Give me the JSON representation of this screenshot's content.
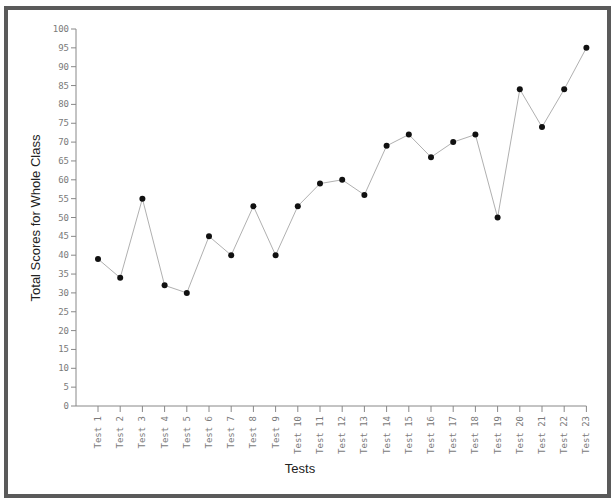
{
  "chart_data": {
    "type": "line",
    "title": "",
    "xlabel": "Tests",
    "ylabel": "Total Scores for Whole Class",
    "categories": [
      "Test 1",
      "Test 2",
      "Test 3",
      "Test 4",
      "Test 5",
      "Test 6",
      "Test 7",
      "Test 8",
      "Test 9",
      "Test 10",
      "Test 11",
      "Test 12",
      "Test 13",
      "Test 14",
      "Test 15",
      "Test 16",
      "Test 17",
      "Test 18",
      "Test 19",
      "Test 20",
      "Test 21",
      "Test 22",
      "Test 23"
    ],
    "values": [
      39,
      34,
      55,
      32,
      30,
      45,
      40,
      53,
      40,
      53,
      59,
      60,
      56,
      69,
      72,
      66,
      70,
      72,
      50,
      84,
      74,
      84,
      95
    ],
    "ylim": [
      0,
      100
    ],
    "yticks": [
      0,
      5,
      10,
      15,
      20,
      25,
      30,
      35,
      40,
      45,
      50,
      55,
      60,
      65,
      70,
      75,
      80,
      85,
      90,
      95,
      100
    ],
    "grid": false,
    "legend": null,
    "colors": {
      "line": "#b0b0b0",
      "marker": "#111111",
      "axis": "#888888",
      "frame": "#5a5a5a"
    }
  }
}
